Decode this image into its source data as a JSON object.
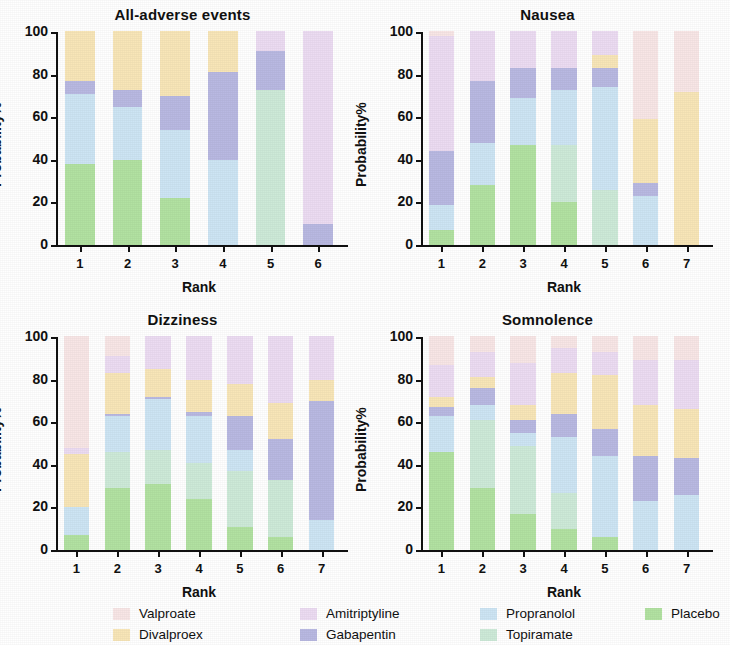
{
  "figure": {
    "ylabel": "Probability%",
    "xlabel": "Rank",
    "ytick_labels": [
      "0",
      "20",
      "40",
      "60",
      "80",
      "100"
    ]
  },
  "legend": {
    "items": [
      {
        "label": "Valproate",
        "color": "#f8e6e6"
      },
      {
        "label": "Divalproex",
        "color": "#f8e6b8"
      },
      {
        "label": "Amitriptyline",
        "color": "#ecdcf2"
      },
      {
        "label": "Gabapentin",
        "color": "#b9b9e2"
      },
      {
        "label": "Propranolol",
        "color": "#cde5f4"
      },
      {
        "label": "Topiramate",
        "color": "#cdead8"
      },
      {
        "label": "Placebo",
        "color": "#b2e2a2"
      }
    ]
  },
  "chart_data": [
    {
      "type": "bar",
      "stacked": true,
      "title": "All-adverse events",
      "xlabel": "Rank",
      "ylabel": "Probability%",
      "ylim": [
        0,
        100
      ],
      "yticks": [
        0,
        20,
        40,
        60,
        80,
        100
      ],
      "grid": false,
      "legend_position": "bottom",
      "categories": [
        "1",
        "2",
        "3",
        "4",
        "5",
        "6"
      ],
      "series": [
        {
          "name": "Placebo",
          "color": "#b2e2a2",
          "values": [
            38,
            40,
            22,
            0,
            0,
            0
          ]
        },
        {
          "name": "Topiramate",
          "color": "#cdead8",
          "values": [
            0,
            0,
            0,
            0,
            73,
            0
          ]
        },
        {
          "name": "Propranolol",
          "color": "#cde5f4",
          "values": [
            33,
            25,
            32,
            40,
            0,
            0
          ]
        },
        {
          "name": "Gabapentin",
          "color": "#b9b9e2",
          "values": [
            6,
            8,
            16,
            41,
            18,
            10
          ]
        },
        {
          "name": "Divalproex",
          "color": "#f8e6b8",
          "values": [
            23,
            27,
            30,
            19,
            0,
            0
          ]
        },
        {
          "name": "Amitriptyline",
          "color": "#ecdcf2",
          "values": [
            0,
            0,
            0,
            0,
            9,
            90
          ]
        },
        {
          "name": "Valproate",
          "color": "#f8e6e6",
          "values": [
            0,
            0,
            0,
            0,
            0,
            0
          ]
        }
      ]
    },
    {
      "type": "bar",
      "stacked": true,
      "title": "Nausea",
      "xlabel": "Rank",
      "ylabel": "Probability%",
      "ylim": [
        0,
        100
      ],
      "yticks": [
        0,
        20,
        40,
        60,
        80,
        100
      ],
      "grid": false,
      "legend_position": "bottom",
      "categories": [
        "1",
        "2",
        "3",
        "4",
        "5",
        "6",
        "7"
      ],
      "series": [
        {
          "name": "Placebo",
          "color": "#b2e2a2",
          "values": [
            7,
            28,
            47,
            20,
            0,
            0,
            0
          ]
        },
        {
          "name": "Topiramate",
          "color": "#cdead8",
          "values": [
            0,
            0,
            0,
            27,
            26,
            0,
            0
          ]
        },
        {
          "name": "Propranolol",
          "color": "#cde5f4",
          "values": [
            12,
            20,
            22,
            26,
            48,
            23,
            0
          ]
        },
        {
          "name": "Gabapentin",
          "color": "#b9b9e2",
          "values": [
            25,
            29,
            14,
            10,
            9,
            6,
            0
          ]
        },
        {
          "name": "Divalproex",
          "color": "#f8e6b8",
          "values": [
            0,
            0,
            0,
            0,
            6,
            30,
            72
          ]
        },
        {
          "name": "Amitriptyline",
          "color": "#ecdcf2",
          "values": [
            54,
            23,
            17,
            17,
            11,
            0,
            0
          ]
        },
        {
          "name": "Valproate",
          "color": "#f8e6e6",
          "values": [
            2,
            0,
            0,
            0,
            0,
            41,
            28
          ]
        }
      ]
    },
    {
      "type": "bar",
      "stacked": true,
      "title": "Dizziness",
      "xlabel": "Rank",
      "ylabel": "Probability%",
      "ylim": [
        0,
        100
      ],
      "yticks": [
        0,
        20,
        40,
        60,
        80,
        100
      ],
      "grid": false,
      "legend_position": "bottom",
      "categories": [
        "1",
        "2",
        "3",
        "4",
        "5",
        "6",
        "7"
      ],
      "series": [
        {
          "name": "Placebo",
          "color": "#b2e2a2",
          "values": [
            7,
            29,
            31,
            24,
            11,
            6,
            0
          ]
        },
        {
          "name": "Topiramate",
          "color": "#cdead8",
          "values": [
            0,
            17,
            16,
            17,
            26,
            27,
            0
          ]
        },
        {
          "name": "Propranolol",
          "color": "#cde5f4",
          "values": [
            13,
            17,
            24,
            22,
            10,
            0,
            14
          ]
        },
        {
          "name": "Gabapentin",
          "color": "#b9b9e2",
          "values": [
            0,
            1,
            1,
            2,
            16,
            19,
            56
          ]
        },
        {
          "name": "Divalproex",
          "color": "#f8e6b8",
          "values": [
            25,
            19,
            13,
            15,
            15,
            17,
            10
          ]
        },
        {
          "name": "Amitriptyline",
          "color": "#ecdcf2",
          "values": [
            3,
            8,
            15,
            20,
            22,
            31,
            20
          ]
        },
        {
          "name": "Valproate",
          "color": "#f8e6e6",
          "values": [
            52,
            9,
            0,
            0,
            0,
            0,
            0
          ]
        }
      ]
    },
    {
      "type": "bar",
      "stacked": true,
      "title": "Somnolence",
      "xlabel": "Rank",
      "ylabel": "Probability%",
      "ylim": [
        0,
        100
      ],
      "yticks": [
        0,
        20,
        40,
        60,
        80,
        100
      ],
      "grid": false,
      "legend_position": "bottom",
      "categories": [
        "1",
        "2",
        "3",
        "4",
        "5",
        "6",
        "7"
      ],
      "series": [
        {
          "name": "Placebo",
          "color": "#b2e2a2",
          "values": [
            46,
            29,
            17,
            10,
            6,
            0,
            0
          ]
        },
        {
          "name": "Topiramate",
          "color": "#cdead8",
          "values": [
            0,
            32,
            32,
            17,
            0,
            0,
            0
          ]
        },
        {
          "name": "Propranolol",
          "color": "#cde5f4",
          "values": [
            17,
            7,
            6,
            26,
            38,
            23,
            26
          ]
        },
        {
          "name": "Gabapentin",
          "color": "#b9b9e2",
          "values": [
            4,
            8,
            6,
            11,
            13,
            21,
            17
          ]
        },
        {
          "name": "Divalproex",
          "color": "#f8e6b8",
          "values": [
            5,
            5,
            7,
            19,
            25,
            24,
            23
          ]
        },
        {
          "name": "Amitriptyline",
          "color": "#ecdcf2",
          "values": [
            15,
            12,
            20,
            12,
            11,
            21,
            23
          ]
        },
        {
          "name": "Valproate",
          "color": "#f8e6e6",
          "values": [
            13,
            7,
            12,
            5,
            7,
            11,
            11
          ]
        }
      ]
    }
  ]
}
